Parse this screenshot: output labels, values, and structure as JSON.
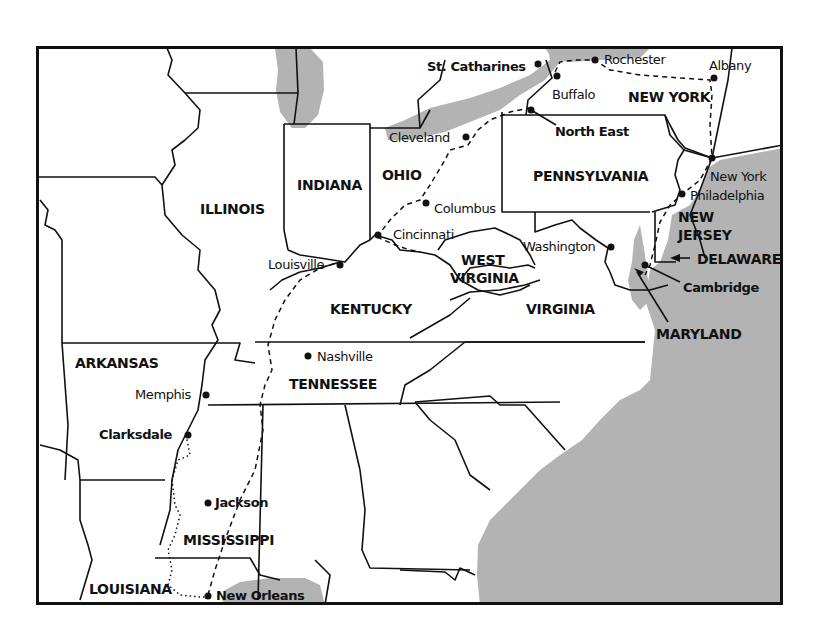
{
  "map": {
    "colors": {
      "water": "#b3b3b3",
      "land": "#ffffff",
      "border": "#111111",
      "frame": "#111111"
    },
    "states": [
      {
        "id": "illinois",
        "label": "ILLINOIS"
      },
      {
        "id": "indiana",
        "label": "INDIANA"
      },
      {
        "id": "ohio",
        "label": "OHIO"
      },
      {
        "id": "pennsylvania",
        "label": "PENNSYLVANIA"
      },
      {
        "id": "new-york",
        "label": "NEW YORK"
      },
      {
        "id": "new-jersey-1",
        "label": "NEW"
      },
      {
        "id": "new-jersey-2",
        "label": "JERSEY"
      },
      {
        "id": "delaware",
        "label": "DELAWARE"
      },
      {
        "id": "maryland",
        "label": "MARYLAND"
      },
      {
        "id": "west-virginia-1",
        "label": "WEST"
      },
      {
        "id": "west-virginia-2",
        "label": "VIRGINIA"
      },
      {
        "id": "virginia",
        "label": "VIRGINIA"
      },
      {
        "id": "kentucky",
        "label": "KENTUCKY"
      },
      {
        "id": "tennessee",
        "label": "TENNESSEE"
      },
      {
        "id": "arkansas",
        "label": "ARKANSAS"
      },
      {
        "id": "mississippi",
        "label": "MISSISSIPPI"
      },
      {
        "id": "louisiana",
        "label": "LOUISIANA"
      }
    ],
    "cities": [
      {
        "id": "st-catharines",
        "label": "St. Catharines",
        "bold": true
      },
      {
        "id": "rochester",
        "label": "Rochester",
        "bold": false
      },
      {
        "id": "albany",
        "label": "Albany",
        "bold": false
      },
      {
        "id": "buffalo",
        "label": "Buffalo",
        "bold": false
      },
      {
        "id": "north-east",
        "label": "North East",
        "bold": true
      },
      {
        "id": "cleveland",
        "label": "Cleveland",
        "bold": false
      },
      {
        "id": "columbus",
        "label": "Columbus",
        "bold": false
      },
      {
        "id": "cincinnati",
        "label": "Cincinnati",
        "bold": false
      },
      {
        "id": "louisville",
        "label": "Louisville",
        "bold": false
      },
      {
        "id": "new-york",
        "label": "New York",
        "bold": false
      },
      {
        "id": "philadelphia",
        "label": "Philadelphia",
        "bold": false
      },
      {
        "id": "washington",
        "label": "Washington",
        "bold": false
      },
      {
        "id": "cambridge",
        "label": "Cambridge",
        "bold": true
      },
      {
        "id": "nashville",
        "label": "Nashville",
        "bold": false
      },
      {
        "id": "memphis",
        "label": "Memphis",
        "bold": false
      },
      {
        "id": "clarksdale",
        "label": "Clarksdale",
        "bold": true
      },
      {
        "id": "jackson",
        "label": "Jackson",
        "bold": true
      },
      {
        "id": "new-orleans",
        "label": "New Orleans",
        "bold": true
      }
    ],
    "routes": [
      {
        "id": "route-dashed",
        "style": "dashed",
        "description": "New Orleans–Jackson–Nashville–Louisville–Cincinnati–Columbus–Cleveland–North East–Buffalo–Rochester–Albany–New York–Philadelphia–Cambridge"
      },
      {
        "id": "route-dotted",
        "style": "dotted",
        "description": "Clarksdale–Mississippi River–New Orleans"
      }
    ]
  }
}
